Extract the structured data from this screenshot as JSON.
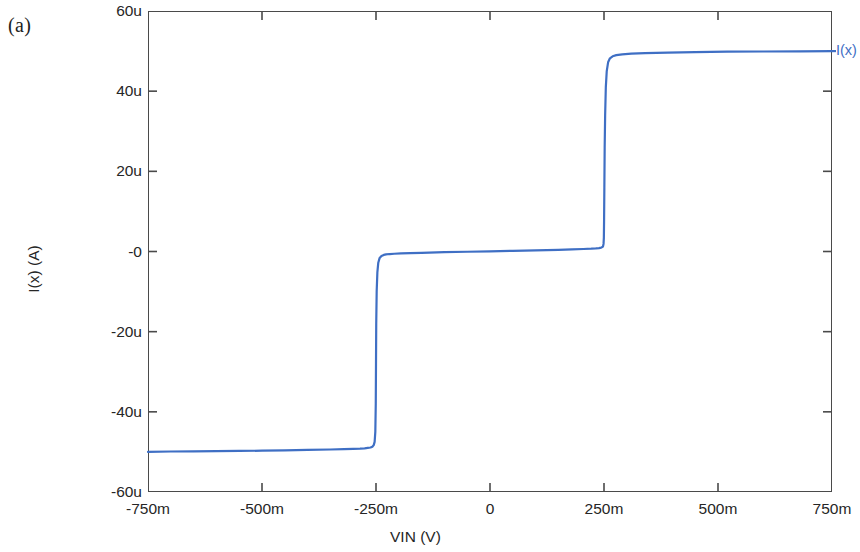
{
  "figure": {
    "panel_label": "(a)",
    "background_color": "#ffffff",
    "frame_color": "#4a4a4a"
  },
  "chart_data": {
    "type": "line",
    "title": "",
    "subtitle": "",
    "xlabel": "VIN  (V)",
    "ylabel": "I(x)  (A)",
    "xlim": [
      -0.75,
      0.75
    ],
    "ylim": [
      -6e-05,
      6e-05
    ],
    "xlim_display": [
      "-750m",
      "750m"
    ],
    "ylim_display": [
      "-60u",
      "60u"
    ],
    "xtick_values": [
      -0.75,
      -0.5,
      -0.25,
      0,
      0.25,
      0.5,
      0.75
    ],
    "xtick_labels": [
      "-750m",
      "-500m",
      "-250m",
      "0",
      "250m",
      "500m",
      "750m"
    ],
    "ytick_values": [
      6e-05,
      4e-05,
      2e-05,
      0,
      -2e-05,
      -4e-05,
      -6e-05
    ],
    "ytick_labels": [
      "60u",
      "40u",
      "20u",
      "-0",
      "-20u",
      "-40u",
      "-60u"
    ],
    "grid": false,
    "legend_position": "right-outside",
    "series": [
      {
        "name": "I(x)",
        "color": "#3f6fc4",
        "line_width": 2.2,
        "x": [
          -0.75,
          -0.7,
          -0.65,
          -0.6,
          -0.55,
          -0.5,
          -0.45,
          -0.4,
          -0.35,
          -0.32,
          -0.3,
          -0.285,
          -0.275,
          -0.268,
          -0.262,
          -0.258,
          -0.255,
          -0.253,
          -0.2515,
          -0.2505,
          -0.25,
          -0.2495,
          -0.2485,
          -0.247,
          -0.245,
          -0.242,
          -0.238,
          -0.233,
          -0.228,
          -0.22,
          -0.21,
          -0.195,
          -0.175,
          -0.15,
          -0.1,
          -0.05,
          0.0,
          0.05,
          0.1,
          0.15,
          0.18,
          0.205,
          0.222,
          0.232,
          0.239,
          0.244,
          0.2465,
          0.248,
          0.249,
          0.2497,
          0.2502,
          0.2508,
          0.2515,
          0.2525,
          0.254,
          0.256,
          0.259,
          0.263,
          0.269,
          0.277,
          0.29,
          0.31,
          0.34,
          0.39,
          0.45,
          0.52,
          0.6,
          0.68,
          0.75
        ],
        "y": [
          -5e-05,
          -4.99e-05,
          -4.985e-05,
          -4.98e-05,
          -4.975e-05,
          -4.97e-05,
          -4.96e-05,
          -4.95e-05,
          -4.94e-05,
          -4.93e-05,
          -4.925e-05,
          -4.92e-05,
          -4.91e-05,
          -4.9e-05,
          -4.89e-05,
          -4.87e-05,
          -4.83e-05,
          -4.75e-05,
          -4.5e-05,
          -3.8e-05,
          -2.8e-05,
          -1.8e-05,
          -1e-05,
          -5.2e-06,
          -2.8e-06,
          -1.6e-06,
          -1.1e-06,
          -8.5e-07,
          -7.2e-07,
          -6.3e-07,
          -5.6e-07,
          -4.8e-07,
          -4e-07,
          -3.2e-07,
          -1.8e-07,
          -6e-08,
          4e-08,
          1.6e-07,
          2.8e-07,
          4.2e-07,
          5.2e-07,
          6.2e-07,
          7e-07,
          7.8e-07,
          8.6e-07,
          9.8e-07,
          1.1e-06,
          1.35e-06,
          1.9e-06,
          3.4e-06,
          8e-06,
          1.6e-05,
          2.6e-05,
          3.4e-05,
          4.1e-05,
          4.5e-05,
          4.72e-05,
          4.82e-05,
          4.87e-05,
          4.9e-05,
          4.92e-05,
          4.935e-05,
          4.95e-05,
          4.96e-05,
          4.975e-05,
          4.985e-05,
          4.99e-05,
          4.995e-05,
          5e-05
        ],
        "annotations": {
          "low_plateau_value": "-50u",
          "mid_plateau_value": "0",
          "high_plateau_value": "50u",
          "transition_1_x": "-250m",
          "transition_2_x": "250m"
        }
      }
    ]
  }
}
